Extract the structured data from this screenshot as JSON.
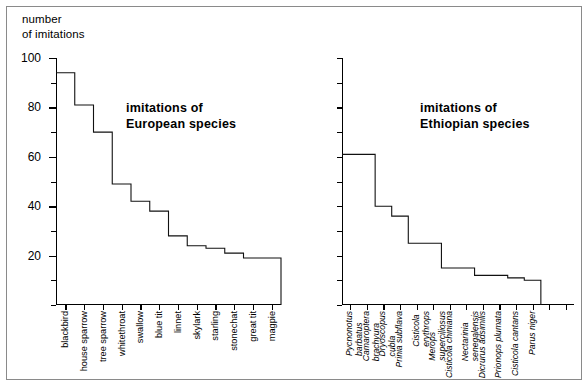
{
  "figure": {
    "axis_caption": "number\nof imitations"
  },
  "chart_data": [
    {
      "type": "bar",
      "id": "european",
      "title": "imitations of\nEuropean species",
      "xlabel": "",
      "ylabel": "number of imitations",
      "ylim": [
        0,
        100
      ],
      "ytick_values": [
        0,
        10,
        20,
        30,
        40,
        50,
        60,
        70,
        80,
        90,
        100
      ],
      "ytick_labels": [
        "",
        "",
        "20",
        "",
        "40",
        "",
        "60",
        "",
        "80",
        "",
        "100"
      ],
      "grid": false,
      "legend": "none",
      "categories": [
        "blackbird",
        "house sparrow",
        "tree sparrow",
        "whitethroat",
        "swallow",
        "blue tit",
        "linnet",
        "skylark",
        "starling",
        "stonechat",
        "great tit",
        "magpie"
      ],
      "values": [
        94,
        81,
        70,
        49,
        42,
        38,
        28,
        24,
        23,
        21,
        19,
        19
      ]
    },
    {
      "type": "bar",
      "id": "ethiopian",
      "title": "imitations of\nEthiopian species",
      "xlabel": "",
      "ylabel": "number of imitations",
      "ylim": [
        0,
        100
      ],
      "ytick_values": [
        0,
        10,
        20,
        30,
        40,
        50,
        60,
        70,
        80,
        90,
        100
      ],
      "ytick_labels": [
        "",
        "",
        "",
        "",
        "",
        "",
        "",
        "",
        "",
        "",
        ""
      ],
      "grid": false,
      "legend": "none",
      "categories": [
        "Pycnonotus barbatus",
        "Camaroptera brachyura",
        "Dryoscopus cubla",
        "Prinia subflava",
        "Cisticola erythrops",
        "Merops superciliosus",
        "Cisticola chiniana",
        "Nectarinia senegalensis",
        "Dicrurus adsimilis",
        "Prionops plumata",
        "Cisticola cantans",
        "Parus niger"
      ],
      "category_lines": [
        [
          "Pycnonotus",
          "barbatus"
        ],
        [
          "Camaroptera",
          "brachyura"
        ],
        [
          "Dryoscopus",
          "cubla"
        ],
        [
          "Prinia subflava",
          ""
        ],
        [
          "Cisticola",
          "erythrops"
        ],
        [
          "Merops",
          "superciliosus"
        ],
        [
          "Cisticola chiniana",
          ""
        ],
        [
          "Nectarinia",
          "senegalensis"
        ],
        [
          "Dicrurus adsimilis",
          ""
        ],
        [
          "Prionops plumata",
          ""
        ],
        [
          "Cisticola cantans",
          ""
        ],
        [
          "Parus niger",
          ""
        ]
      ],
      "values": [
        61,
        61,
        40,
        36,
        25,
        25,
        15,
        15,
        12,
        12,
        11,
        10
      ],
      "tick_count": 14
    }
  ]
}
